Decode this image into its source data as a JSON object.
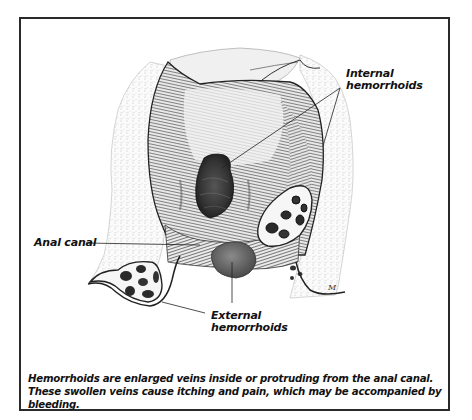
{
  "figure": {
    "labels": {
      "internal": [
        "Internal",
        "hemorrhoids"
      ],
      "anal_canal": "Anal canal",
      "external": [
        "External",
        "hemorrhoids"
      ]
    },
    "caption": "Hemorrhoids are enlarged veins inside or protruding from the anal canal. These swollen veins cause itching and pain, which may be accompanied by bleeding.",
    "artist_signature": "M",
    "colors": {
      "frame": "#2a2a2a",
      "ink": "#111111",
      "tissue_dark": "#3a3a3a",
      "tissue_mid": "#8a8a8a",
      "fat_tissue": "#f4f4f4"
    }
  }
}
